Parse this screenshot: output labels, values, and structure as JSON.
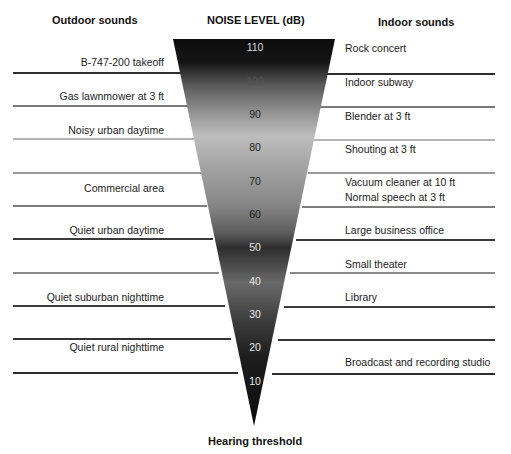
{
  "headings": {
    "outdoor": "Outdoor sounds",
    "center": "NOISE LEVEL (dB)",
    "indoor": "Indoor sounds",
    "bottom": "Hearing threshold"
  },
  "levels": [
    "110",
    "100",
    "90",
    "80",
    "70",
    "60",
    "50",
    "40",
    "30",
    "20",
    "10"
  ],
  "outdoor_sounds": [
    {
      "label": "B-747-200 takeoff",
      "db": 105
    },
    {
      "label": "Gas lawnmower at 3 ft",
      "db": 95
    },
    {
      "label": "Noisy urban daytime",
      "db": 85
    },
    {
      "label": "Commercial area",
      "db": 68
    },
    {
      "label": "Quiet urban daytime",
      "db": 55
    },
    {
      "label": "Quiet suburban nighttime",
      "db": 35
    },
    {
      "label": "Quiet rural nighttime",
      "db": 20
    }
  ],
  "indoor_sounds": [
    {
      "label": "Rock concert",
      "db": 110
    },
    {
      "label": "Indoor subway",
      "db": 100
    },
    {
      "label": "Blender at 3 ft",
      "db": 90
    },
    {
      "label": "Shouting at 3 ft",
      "db": 80
    },
    {
      "label": "Vacuum cleaner at 10 ft",
      "db": 70
    },
    {
      "label": "Normal speech at 3 ft",
      "db": 65
    },
    {
      "label": "Large business office",
      "db": 55
    },
    {
      "label": "Small theater",
      "db": 45
    },
    {
      "label": "Library",
      "db": 35
    },
    {
      "label": "Broadcast and recording studio",
      "db": 15
    }
  ],
  "colors": {
    "funnel_dark": "#0d0d0d",
    "funnel_light": "#bdbdbd",
    "rule_dark": "#333333",
    "rule_light": "#a8a8a8"
  }
}
